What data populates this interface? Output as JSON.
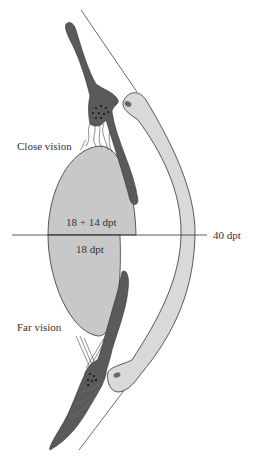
{
  "diagram": {
    "type": "anatomical-accommodation-diagram",
    "labels": {
      "close_vision": "Close vision",
      "far_vision": "Far vision",
      "upper_lens_power": "18 + 14 dpt",
      "lower_lens_power": "18 dpt",
      "cornea_power": "40 dpt"
    },
    "colors": {
      "lens_fill": "#c8c8c8",
      "cornea_fill": "#d9d9d9",
      "ciliary_fill": "#5a5a5a",
      "outline": "#333333",
      "background": "#ffffff"
    }
  }
}
